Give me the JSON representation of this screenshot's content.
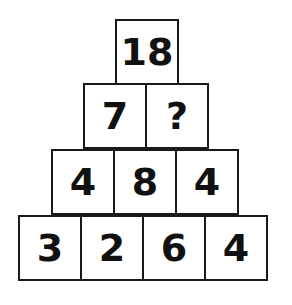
{
  "puzzle": {
    "type": "number-pyramid",
    "rows": [
      {
        "cells": [
          "18"
        ]
      },
      {
        "cells": [
          "7",
          "?"
        ]
      },
      {
        "cells": [
          "4",
          "8",
          "4"
        ]
      },
      {
        "cells": [
          "3",
          "2",
          "6",
          "4"
        ]
      }
    ]
  },
  "colors": {
    "background": "#ffffff",
    "border": "#1a1a1a",
    "text": "#111111"
  }
}
